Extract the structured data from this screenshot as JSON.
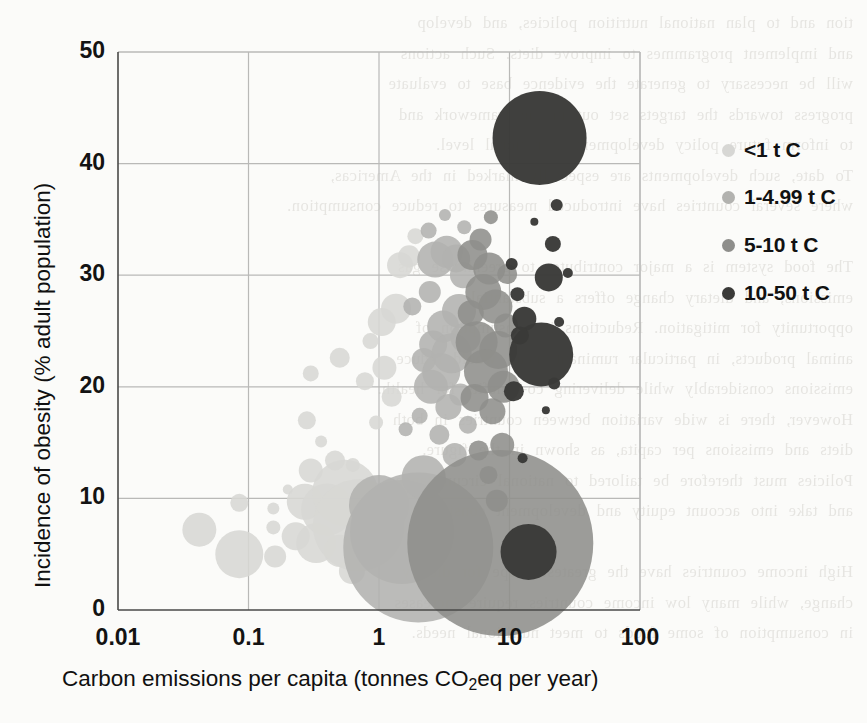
{
  "page": {
    "background": "#fbfbf9",
    "bleed_through_text": "tion and to plan national nutrition policies, and develop\nand implement programmes to improve diets. Such actions\nwill be necessary to generate the evidence base to evaluate\nprogress towards the targets set out in the framework and\nto inform future policy development at national level.\nTo date, such developments are especially marked in the Americas,\nwhere several countries have introduced measures to reduce consumption.\n\nThe food system is a major contributor to greenhouse gas\nemissions, and dietary change offers a substantial\nopportunity for mitigation. Reductions in consumption of\nanimal products, in particular ruminant meat, would reduce\nemissions considerably while delivering co-benefits for health.\nHowever, there is wide variation between countries in both\ndiets and emissions per capita, as shown in the figure.\nPolicies must therefore be tailored to national circumstances\nand take into account equity and development considerations.\n\nHigh income countries have the greatest scope for dietary\nchange, while many low income countries require increases\nin consumption of some foods to meet nutritional needs."
  },
  "chart_data": {
    "type": "scatter",
    "title": "",
    "xlabel": "Carbon emissions per capita (tonnes CO2eq per year)",
    "xlabel_parts": {
      "pre": "Carbon emissions per capita (tonnes CO",
      "sub": "2",
      "post": "eq per year)"
    },
    "ylabel": "Incidence of obesity (% adult population)",
    "xscale": "log",
    "yscale": "linear",
    "xlim": [
      0.01,
      100
    ],
    "ylim": [
      0,
      50
    ],
    "xticks": [
      "0.01",
      "0.1",
      "1",
      "10",
      "100"
    ],
    "xtick_values": [
      0.01,
      0.1,
      1,
      10,
      100
    ],
    "yticks": [
      "0",
      "10",
      "20",
      "30",
      "40",
      "50"
    ],
    "ytick_values": [
      0,
      10,
      20,
      30,
      40,
      50
    ],
    "grid": true,
    "grid_color": "#b9b9b7",
    "bubble_size_meaning": "population",
    "legend": {
      "title": "",
      "position": "right",
      "entries": [
        {
          "label": "<1 t C",
          "color": "#d7d7d4"
        },
        {
          "label": "1-4.99 t C",
          "color": "#b2b2af"
        },
        {
          "label": "5-10 t C",
          "color": "#8e8e8b"
        },
        {
          "label": "10-50 t C",
          "color": "#3a3a38"
        }
      ]
    },
    "series": [
      {
        "name": "<1 t C",
        "color": "#d7d7d4",
        "points": [
          {
            "x": 0.042,
            "y": 7.2,
            "r": 17
          },
          {
            "x": 0.085,
            "y": 9.6,
            "r": 9
          },
          {
            "x": 0.085,
            "y": 5.0,
            "r": 24
          },
          {
            "x": 0.155,
            "y": 7.4,
            "r": 7
          },
          {
            "x": 0.155,
            "y": 9.1,
            "r": 6
          },
          {
            "x": 0.16,
            "y": 4.8,
            "r": 11
          },
          {
            "x": 0.23,
            "y": 6.6,
            "r": 14
          },
          {
            "x": 0.27,
            "y": 9.7,
            "r": 18
          },
          {
            "x": 0.3,
            "y": 12.5,
            "r": 12
          },
          {
            "x": 0.33,
            "y": 6.0,
            "r": 20
          },
          {
            "x": 0.4,
            "y": 9.0,
            "r": 26
          },
          {
            "x": 0.46,
            "y": 13.4,
            "r": 10
          },
          {
            "x": 0.5,
            "y": 5.3,
            "r": 16
          },
          {
            "x": 0.55,
            "y": 10.5,
            "r": 33
          },
          {
            "x": 0.62,
            "y": 3.5,
            "r": 13
          },
          {
            "x": 0.7,
            "y": 7.6,
            "r": 46
          },
          {
            "x": 0.28,
            "y": 17.0,
            "r": 9
          },
          {
            "x": 0.36,
            "y": 15.1,
            "r": 6
          },
          {
            "x": 0.3,
            "y": 21.2,
            "r": 8
          },
          {
            "x": 0.5,
            "y": 22.6,
            "r": 10
          },
          {
            "x": 0.78,
            "y": 20.5,
            "r": 9
          },
          {
            "x": 0.95,
            "y": 16.8,
            "r": 7
          },
          {
            "x": 1.05,
            "y": 25.8,
            "r": 14
          },
          {
            "x": 1.35,
            "y": 27.0,
            "r": 15
          },
          {
            "x": 1.45,
            "y": 30.9,
            "r": 13
          },
          {
            "x": 1.7,
            "y": 31.7,
            "r": 11
          },
          {
            "x": 1.1,
            "y": 21.7,
            "r": 12
          },
          {
            "x": 0.86,
            "y": 24.1,
            "r": 8
          },
          {
            "x": 1.25,
            "y": 19.1,
            "r": 10
          },
          {
            "x": 0.63,
            "y": 13.0,
            "r": 7
          },
          {
            "x": 0.2,
            "y": 10.8,
            "r": 5
          },
          {
            "x": 1.9,
            "y": 33.5,
            "r": 8
          }
        ]
      },
      {
        "name": "1-4.99 t C",
        "color": "#b2b2af",
        "points": [
          {
            "x": 1.0,
            "y": 9.4,
            "r": 30
          },
          {
            "x": 1.5,
            "y": 7.0,
            "r": 52
          },
          {
            "x": 2.0,
            "y": 5.6,
            "r": 75
          },
          {
            "x": 2.2,
            "y": 11.9,
            "r": 22
          },
          {
            "x": 2.5,
            "y": 20.0,
            "r": 17
          },
          {
            "x": 2.6,
            "y": 23.8,
            "r": 14
          },
          {
            "x": 2.2,
            "y": 22.4,
            "r": 12
          },
          {
            "x": 3.0,
            "y": 21.3,
            "r": 19
          },
          {
            "x": 3.1,
            "y": 25.4,
            "r": 16
          },
          {
            "x": 3.6,
            "y": 23.0,
            "r": 20
          },
          {
            "x": 2.7,
            "y": 31.4,
            "r": 18
          },
          {
            "x": 3.3,
            "y": 32.1,
            "r": 16
          },
          {
            "x": 3.9,
            "y": 31.5,
            "r": 14
          },
          {
            "x": 4.4,
            "y": 30.0,
            "r": 13
          },
          {
            "x": 2.4,
            "y": 34.0,
            "r": 8
          },
          {
            "x": 1.8,
            "y": 27.2,
            "r": 9
          },
          {
            "x": 4.1,
            "y": 26.8,
            "r": 17
          },
          {
            "x": 4.6,
            "y": 24.4,
            "r": 15
          },
          {
            "x": 3.4,
            "y": 18.2,
            "r": 13
          },
          {
            "x": 4.2,
            "y": 19.3,
            "r": 11
          },
          {
            "x": 2.9,
            "y": 15.7,
            "r": 10
          },
          {
            "x": 3.8,
            "y": 13.9,
            "r": 12
          },
          {
            "x": 4.8,
            "y": 16.6,
            "r": 9
          },
          {
            "x": 2.05,
            "y": 17.4,
            "r": 8
          },
          {
            "x": 4.5,
            "y": 34.3,
            "r": 7
          },
          {
            "x": 3.2,
            "y": 35.4,
            "r": 6
          },
          {
            "x": 2.45,
            "y": 28.5,
            "r": 11
          },
          {
            "x": 1.6,
            "y": 16.2,
            "r": 7
          }
        ]
      },
      {
        "name": "5-10 t C",
        "color": "#8e8e8b",
        "points": [
          {
            "x": 8.5,
            "y": 6.0,
            "r": 93
          },
          {
            "x": 5.6,
            "y": 24.0,
            "r": 21
          },
          {
            "x": 6.3,
            "y": 28.5,
            "r": 18
          },
          {
            "x": 7.0,
            "y": 30.6,
            "r": 16
          },
          {
            "x": 5.2,
            "y": 31.8,
            "r": 15
          },
          {
            "x": 6.0,
            "y": 33.2,
            "r": 11
          },
          {
            "x": 7.8,
            "y": 27.2,
            "r": 17
          },
          {
            "x": 8.2,
            "y": 23.3,
            "r": 19
          },
          {
            "x": 6.6,
            "y": 21.4,
            "r": 22
          },
          {
            "x": 5.4,
            "y": 19.0,
            "r": 14
          },
          {
            "x": 7.4,
            "y": 17.8,
            "r": 13
          },
          {
            "x": 9.0,
            "y": 20.0,
            "r": 16
          },
          {
            "x": 9.4,
            "y": 25.5,
            "r": 12
          },
          {
            "x": 5.8,
            "y": 14.3,
            "r": 10
          },
          {
            "x": 8.8,
            "y": 14.8,
            "r": 12
          },
          {
            "x": 6.9,
            "y": 12.1,
            "r": 9
          },
          {
            "x": 5.05,
            "y": 26.6,
            "r": 13
          },
          {
            "x": 9.6,
            "y": 30.1,
            "r": 10
          },
          {
            "x": 7.2,
            "y": 35.2,
            "r": 7
          },
          {
            "x": 8.0,
            "y": 9.8,
            "r": 11
          }
        ]
      },
      {
        "name": "10-50 t C",
        "color": "#3a3a38",
        "points": [
          {
            "x": 17.0,
            "y": 42.3,
            "r": 47
          },
          {
            "x": 17.5,
            "y": 22.9,
            "r": 32
          },
          {
            "x": 14.0,
            "y": 5.2,
            "r": 28
          },
          {
            "x": 20.0,
            "y": 29.8,
            "r": 14
          },
          {
            "x": 23.0,
            "y": 36.3,
            "r": 6
          },
          {
            "x": 21.5,
            "y": 32.8,
            "r": 8
          },
          {
            "x": 28.0,
            "y": 30.2,
            "r": 5
          },
          {
            "x": 13.0,
            "y": 26.1,
            "r": 12
          },
          {
            "x": 24.0,
            "y": 25.8,
            "r": 5
          },
          {
            "x": 22.0,
            "y": 20.3,
            "r": 6
          },
          {
            "x": 19.0,
            "y": 17.9,
            "r": 4
          },
          {
            "x": 12.0,
            "y": 24.6,
            "r": 9
          },
          {
            "x": 11.5,
            "y": 28.3,
            "r": 7
          },
          {
            "x": 15.5,
            "y": 34.8,
            "r": 4
          },
          {
            "x": 10.8,
            "y": 19.6,
            "r": 10
          },
          {
            "x": 12.6,
            "y": 13.6,
            "r": 5
          },
          {
            "x": 10.4,
            "y": 31.0,
            "r": 6
          }
        ]
      }
    ]
  }
}
